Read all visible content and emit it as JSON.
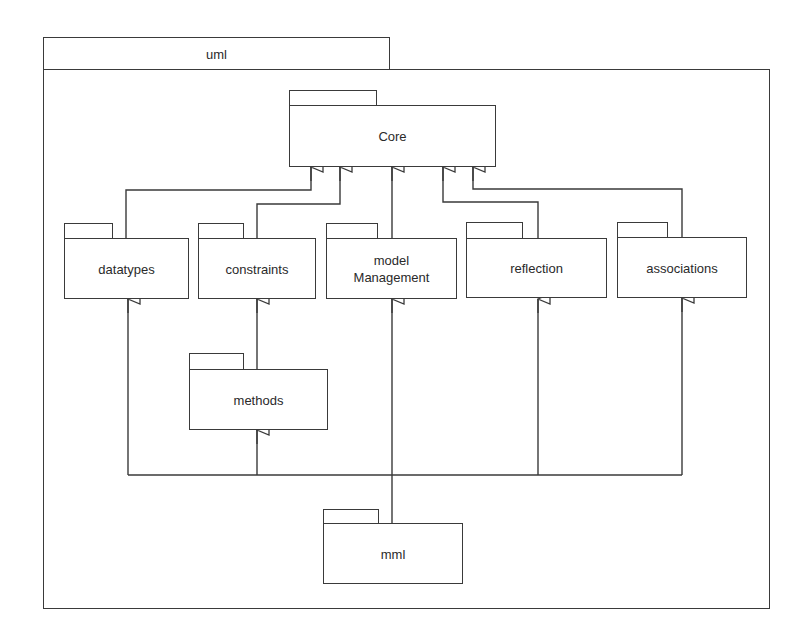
{
  "diagram": {
    "type": "uml-package-diagram",
    "container": {
      "name": "uml"
    },
    "packages": [
      {
        "id": "core",
        "label": "Core"
      },
      {
        "id": "datatypes",
        "label": "datatypes"
      },
      {
        "id": "constraints",
        "label": "constraints"
      },
      {
        "id": "modelManagement",
        "label_line1": "model",
        "label_line2": "Management"
      },
      {
        "id": "reflection",
        "label": "reflection"
      },
      {
        "id": "associations",
        "label": "associations"
      },
      {
        "id": "methods",
        "label": "methods"
      },
      {
        "id": "mml",
        "label": "mml"
      }
    ],
    "dependencies": [
      {
        "from": "datatypes",
        "to": "Core",
        "kind": "generalization"
      },
      {
        "from": "constraints",
        "to": "Core",
        "kind": "generalization"
      },
      {
        "from": "model Management",
        "to": "Core",
        "kind": "generalization"
      },
      {
        "from": "reflection",
        "to": "Core",
        "kind": "generalization"
      },
      {
        "from": "associations",
        "to": "Core",
        "kind": "generalization"
      },
      {
        "from": "methods",
        "to": "constraints",
        "kind": "generalization"
      },
      {
        "from": "mml",
        "to": "datatypes",
        "kind": "generalization"
      },
      {
        "from": "mml",
        "to": "methods",
        "kind": "generalization"
      },
      {
        "from": "mml",
        "to": "model Management",
        "kind": "generalization"
      },
      {
        "from": "mml",
        "to": "reflection",
        "kind": "generalization"
      },
      {
        "from": "mml",
        "to": "associations",
        "kind": "generalization"
      }
    ],
    "colors": {
      "line": "#3a3a3a",
      "text": "#2a2a2a",
      "background": "#ffffff"
    }
  }
}
